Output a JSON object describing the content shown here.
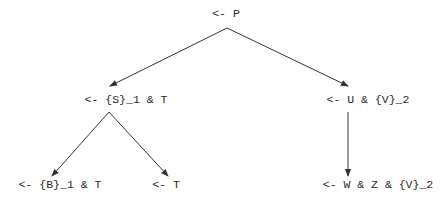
{
  "diagram": {
    "type": "tree",
    "nodes": [
      {
        "id": "root",
        "label": "<- P"
      },
      {
        "id": "left",
        "label": "<- {S}_1 & T"
      },
      {
        "id": "right",
        "label": "<- U & {V}_2"
      },
      {
        "id": "left-left",
        "label": "<- {B}_1 & T"
      },
      {
        "id": "left-right",
        "label": "<- T"
      },
      {
        "id": "right-child",
        "label": "<- W & Z & {V}_2"
      }
    ],
    "edges": [
      {
        "from": "root",
        "to": "left"
      },
      {
        "from": "root",
        "to": "right"
      },
      {
        "from": "left",
        "to": "left-left"
      },
      {
        "from": "left",
        "to": "left-right"
      },
      {
        "from": "right",
        "to": "right-child"
      }
    ],
    "colors": {
      "line": "#333333",
      "text": "#2a2a2a"
    }
  }
}
